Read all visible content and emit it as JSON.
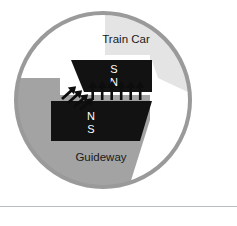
{
  "figure": {
    "background_color": "#ffffff"
  },
  "circle": {
    "name": "circular-diagram-frame",
    "center_x": 103,
    "center_y": 100,
    "radius": 89,
    "ring_color": "#9a9a9a",
    "ring_width": 4,
    "interior_color": "#ffffff"
  },
  "regions": {
    "train_car": {
      "label": "Train Car",
      "fill": "#ffffff",
      "shade_fill": "#e3e3e3",
      "label_x": 126,
      "label_y": 43
    },
    "guideway": {
      "label": "Guideway",
      "fill": "#a3a3a3",
      "label_x": 103,
      "label_y": 157
    }
  },
  "magnets": {
    "upper": {
      "name": "train-car-magnet",
      "fill": "#121212",
      "poles": [
        "S",
        "N"
      ],
      "pole_top": "S",
      "pole_bottom": "N",
      "pole_x": 114,
      "pole_top_y": 69,
      "pole_bottom_y": 82
    },
    "lower": {
      "name": "guideway-magnet",
      "fill": "#121212",
      "poles": [
        "N",
        "S"
      ],
      "pole_top": "N",
      "pole_bottom": "S",
      "pole_x": 92,
      "pole_top_y": 117,
      "pole_bottom_y": 130
    }
  },
  "arrows": {
    "vertical": {
      "name": "levitation-force-arrows",
      "count": 6,
      "color": "#0d0d0d",
      "direction": "up",
      "start_x": 93,
      "spacing": 9.5,
      "base_y": 99,
      "tip_y": 84
    },
    "diagonal": {
      "name": "propulsion-force-arrows",
      "count": 4,
      "color": "#0d0d0d",
      "direction": "up-right",
      "angle_deg": -42
    }
  },
  "bottom_rule": {
    "name": "horizontal-divider",
    "color": "#b9bcc0"
  },
  "legend_text": {
    "train_car": "Train Car",
    "guideway": "Guideway",
    "upper_pole_top": "S",
    "upper_pole_bottom": "N",
    "lower_pole_top": "N",
    "lower_pole_bottom": "S"
  }
}
